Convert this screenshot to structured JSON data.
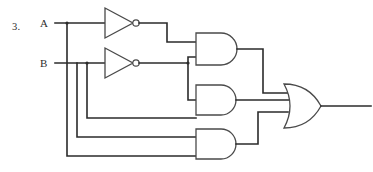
{
  "diagram": {
    "problem_number": "3.",
    "inputs": [
      {
        "name": "A",
        "label": "A",
        "y": 23
      },
      {
        "name": "B",
        "label": "B",
        "y": 63
      }
    ],
    "colors": {
      "wire": "#2b2b2b",
      "gate_outline": "#4a4a4a",
      "background": "#ffffff",
      "text": "#2e2e2e"
    },
    "gates": [
      {
        "id": "not1",
        "type": "NOT",
        "inputs": [
          "A"
        ],
        "output": "notA",
        "x": 105,
        "y": 23
      },
      {
        "id": "not2",
        "type": "NOT",
        "inputs": [
          "B"
        ],
        "output": "notB",
        "x": 105,
        "y": 63
      },
      {
        "id": "and1",
        "type": "AND",
        "inputs": [
          "notA",
          "notB"
        ],
        "output": "and1out",
        "x": 196,
        "y": 49
      },
      {
        "id": "and2",
        "type": "AND",
        "inputs": [
          "notB",
          "B"
        ],
        "output": "and2out",
        "x": 196,
        "y": 100
      },
      {
        "id": "and3",
        "type": "AND",
        "inputs": [
          "B",
          "A"
        ],
        "output": "and3out",
        "x": 196,
        "y": 144
      },
      {
        "id": "or1",
        "type": "OR",
        "inputs": [
          "and1out",
          "and2out",
          "and3out"
        ],
        "output": "Y",
        "x": 284,
        "y": 106
      }
    ],
    "output": {
      "name": "output-wire",
      "x_end": 371,
      "y": 106
    }
  }
}
